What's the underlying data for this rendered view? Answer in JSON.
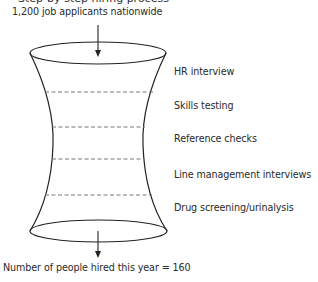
{
  "diagram": {
    "top_cut_text": "Step-by-step hiring process",
    "input_label": "1,200 job applicants nationwide",
    "stages": [
      {
        "label": "HR interview"
      },
      {
        "label": "Skills testing"
      },
      {
        "label": "Reference checks"
      },
      {
        "label": "Line management interviews"
      },
      {
        "label": "Drug screening/urinalysis"
      }
    ],
    "output_label": "Number of people hired this year = 160",
    "colors": {
      "stroke": "#222222",
      "dash": "#777777",
      "text": "#2a2a2a"
    }
  }
}
